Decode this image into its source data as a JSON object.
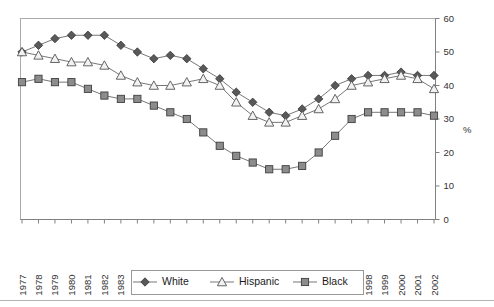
{
  "chart_data": {
    "type": "line",
    "title": "",
    "subtitle": "",
    "xlabel": "",
    "ylabel": "%",
    "ylim": [
      0,
      60
    ],
    "yticks": [
      0,
      10,
      20,
      30,
      40,
      50,
      60
    ],
    "y_axis_position": "right",
    "grid": false,
    "legend_position": "bottom",
    "categories": [
      "1977",
      "1978",
      "1979",
      "1980",
      "1981",
      "1982",
      "1983",
      "1984",
      "1985",
      "1986",
      "1987",
      "1988",
      "1989",
      "1990",
      "1991",
      "1992",
      "1993",
      "1994",
      "1995",
      "1996",
      "1997",
      "1998",
      "1999",
      "2000",
      "2001",
      "2002"
    ],
    "series": [
      {
        "name": "White",
        "marker": "diamond",
        "color": "#595959",
        "values": [
          50,
          52,
          54,
          55,
          55,
          55,
          52,
          50,
          48,
          49,
          48,
          45,
          42,
          38,
          35,
          32,
          31,
          33,
          36,
          40,
          42,
          43,
          43,
          44,
          43,
          43
        ]
      },
      {
        "name": "Hispanic",
        "marker": "triangle",
        "color": "#f2f2f2",
        "values": [
          50,
          49,
          48,
          47,
          47,
          46,
          43,
          41,
          40,
          40,
          41,
          42,
          40,
          35,
          31,
          29,
          29,
          31,
          33,
          36,
          40,
          41,
          42,
          43,
          42,
          39
        ]
      },
      {
        "name": "Black",
        "marker": "square",
        "color": "#8c8c8c",
        "values": [
          41,
          42,
          41,
          41,
          39,
          37,
          36,
          36,
          34,
          32,
          30,
          26,
          22,
          19,
          17,
          15,
          15,
          16,
          20,
          25,
          30,
          32,
          32,
          32,
          32,
          31
        ]
      }
    ],
    "legend_entries": [
      {
        "label": "White",
        "marker": "diamond"
      },
      {
        "label": "Hispanic",
        "marker": "triangle"
      },
      {
        "label": "Black",
        "marker": "square"
      }
    ]
  }
}
